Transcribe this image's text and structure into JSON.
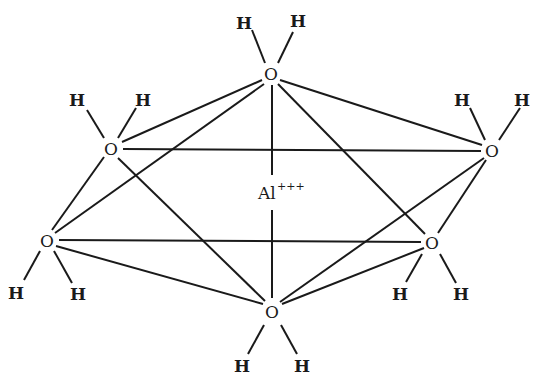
{
  "diagram": {
    "center": {
      "label": "Al",
      "charge": "+++"
    },
    "oxygen_label": "O",
    "hydrogen_label": "H",
    "nodes": [
      {
        "id": "O_top",
        "label": "O"
      },
      {
        "id": "O_upper_left",
        "label": "O"
      },
      {
        "id": "O_upper_right",
        "label": "O"
      },
      {
        "id": "O_lower_left",
        "label": "O"
      },
      {
        "id": "O_lower_right",
        "label": "O"
      },
      {
        "id": "O_bottom",
        "label": "O"
      }
    ],
    "hydrogens": [
      {
        "label": "H"
      },
      {
        "label": "H"
      },
      {
        "label": "H"
      },
      {
        "label": "H"
      },
      {
        "label": "H"
      },
      {
        "label": "H"
      },
      {
        "label": "H"
      },
      {
        "label": "H"
      },
      {
        "label": "H"
      },
      {
        "label": "H"
      },
      {
        "label": "H"
      },
      {
        "label": "H"
      }
    ]
  }
}
